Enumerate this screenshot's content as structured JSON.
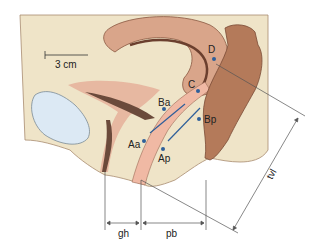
{
  "diagram": {
    "scale_bar": {
      "label": "3 cm"
    },
    "points": [
      {
        "id": "D",
        "label": "D"
      },
      {
        "id": "C",
        "label": "C"
      },
      {
        "id": "Ba",
        "label": "Ba"
      },
      {
        "id": "Bp",
        "label": "Bp"
      },
      {
        "id": "Aa",
        "label": "Aa"
      },
      {
        "id": "Ap",
        "label": "Ap"
      }
    ],
    "measurements": [
      {
        "id": "gh",
        "label": "gh"
      },
      {
        "id": "pb",
        "label": "pb"
      },
      {
        "id": "tvl",
        "label": "tvl"
      }
    ],
    "colors": {
      "tissue": "#efe4c8",
      "organ": "#d9a58a",
      "organ_dark": "#a86a4f",
      "rectum": "#b47a5a",
      "bladder": "#dce9f4",
      "vagina": "#f0b9a4",
      "point": "#2f5f9a",
      "line": "#333333"
    }
  }
}
